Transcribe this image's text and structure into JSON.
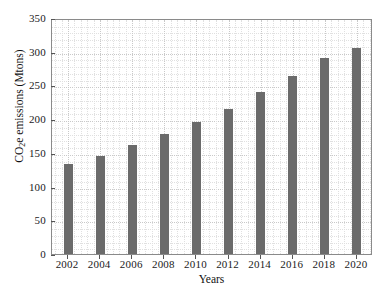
{
  "chart_data": {
    "type": "bar",
    "title": "",
    "subtitle": "",
    "xlabel": "Years",
    "ylabel": "CO2e emissions (Mtons)",
    "ylabel_parts": {
      "prefix": "CO",
      "subscript": "2",
      "suffix": "e emissions (Mtons)"
    },
    "categories": [
      "2002",
      "2004",
      "2006",
      "2008",
      "2010",
      "2012",
      "2014",
      "2016",
      "2018",
      "2020"
    ],
    "values": [
      133,
      146,
      162,
      178,
      196,
      215,
      240,
      264,
      291,
      306
    ],
    "series": [
      {
        "name": "CO2e emissions",
        "values": [
          133,
          146,
          162,
          178,
          196,
          215,
          240,
          264,
          291,
          306
        ]
      }
    ],
    "ylim": [
      0,
      350
    ],
    "ytick_labels": [
      "0",
      "50",
      "100",
      "150",
      "200",
      "250",
      "300",
      "350"
    ],
    "ytick_values": [
      0,
      50,
      100,
      150,
      200,
      250,
      300,
      350
    ],
    "yminor_values": [
      10,
      20,
      30,
      40,
      60,
      70,
      80,
      90,
      110,
      120,
      130,
      140,
      160,
      170,
      180,
      190,
      210,
      220,
      230,
      240,
      260,
      270,
      280,
      290,
      310,
      320,
      330,
      340
    ],
    "xminor_count": 4,
    "grid": true,
    "grid_style": "dotted",
    "legend": null,
    "bar_color": "#6b6b6b",
    "grid_color": "#c9c9c9",
    "axis_color": "#8a8a8a",
    "text_color": "#111111",
    "background_color": "#ffffff",
    "bar_width_px": 9
  }
}
